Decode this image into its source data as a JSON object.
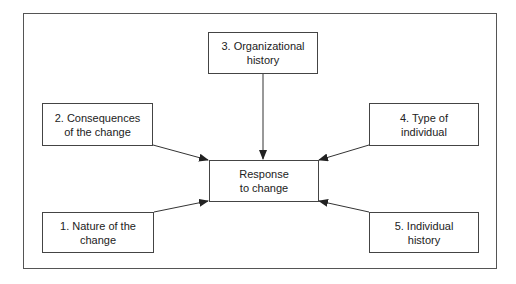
{
  "diagram": {
    "center": {
      "line1": "Response",
      "line2": "to change"
    },
    "boxes": [
      {
        "id": "nature",
        "line1": "1. Nature of the",
        "line2": "change"
      },
      {
        "id": "consequences",
        "line1": "2. Consequences",
        "line2": "of the change"
      },
      {
        "id": "org-history",
        "line1": "3. Organizational",
        "line2": "history"
      },
      {
        "id": "type-individual",
        "line1": "4. Type of",
        "line2": "individual"
      },
      {
        "id": "individual-history",
        "line1": "5. Individual",
        "line2": "history"
      }
    ],
    "edges": [
      {
        "from": "1. Nature of the change",
        "to": "Response to change"
      },
      {
        "from": "2. Consequences of the change",
        "to": "Response to change"
      },
      {
        "from": "3. Organizational history",
        "to": "Response to change"
      },
      {
        "from": "4. Type of individual",
        "to": "Response to change"
      },
      {
        "from": "5. Individual history",
        "to": "Response to change"
      }
    ],
    "colors": {
      "line": "#333333",
      "border": "#444444",
      "background": "#ffffff"
    }
  }
}
